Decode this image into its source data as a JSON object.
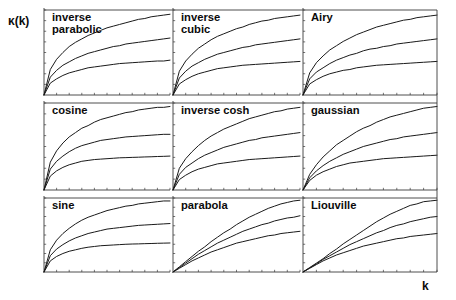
{
  "axes": {
    "ylabel": "κ(k)",
    "xlabel": "k"
  },
  "chart_data": {
    "type": "line",
    "title": "",
    "xlabel": "k",
    "ylabel": "κ(k)",
    "grid": false,
    "legend": "none",
    "layout": {
      "rows": 3,
      "cols": 3,
      "shared_axes": true
    },
    "axis_ranges": {
      "xlim": [
        0,
        1
      ],
      "ylim": [
        0,
        1
      ]
    },
    "series_count_per_panel": 3,
    "series_names": [
      "curve-1",
      "curve-2",
      "curve-3"
    ],
    "x": [
      0,
      0.05,
      0.1,
      0.15,
      0.2,
      0.25,
      0.3,
      0.35,
      0.4,
      0.45,
      0.5,
      0.55,
      0.6,
      0.65,
      0.7,
      0.75,
      0.8,
      0.85,
      0.9,
      0.95,
      1.0
    ],
    "panels": [
      {
        "id": "inverse-parabolic",
        "label": "inverse parabolic",
        "row": 0,
        "col": 0,
        "series": [
          {
            "name": "curve-1",
            "values": [
              0,
              0.3,
              0.42,
              0.5,
              0.57,
              0.62,
              0.66,
              0.7,
              0.73,
              0.76,
              0.79,
              0.81,
              0.83,
              0.85,
              0.87,
              0.89,
              0.9,
              0.92,
              0.93,
              0.94,
              0.95
            ]
          },
          {
            "name": "curve-2",
            "values": [
              0,
              0.21,
              0.29,
              0.35,
              0.39,
              0.43,
              0.46,
              0.49,
              0.51,
              0.53,
              0.55,
              0.57,
              0.58,
              0.6,
              0.61,
              0.62,
              0.63,
              0.64,
              0.65,
              0.66,
              0.67
            ]
          },
          {
            "name": "curve-3",
            "values": [
              0,
              0.14,
              0.19,
              0.23,
              0.26,
              0.28,
              0.3,
              0.32,
              0.33,
              0.34,
              0.35,
              0.36,
              0.37,
              0.375,
              0.38,
              0.385,
              0.39,
              0.395,
              0.4,
              0.4,
              0.41
            ]
          }
        ]
      },
      {
        "id": "inverse-cubic",
        "label": "inverse cubic",
        "row": 0,
        "col": 1,
        "series": [
          {
            "name": "curve-1",
            "values": [
              0,
              0.28,
              0.4,
              0.48,
              0.55,
              0.6,
              0.65,
              0.69,
              0.72,
              0.75,
              0.78,
              0.8,
              0.83,
              0.85,
              0.87,
              0.88,
              0.9,
              0.91,
              0.92,
              0.93,
              0.94
            ]
          },
          {
            "name": "curve-2",
            "values": [
              0,
              0.2,
              0.28,
              0.34,
              0.38,
              0.42,
              0.45,
              0.48,
              0.5,
              0.52,
              0.54,
              0.56,
              0.57,
              0.59,
              0.6,
              0.61,
              0.62,
              0.63,
              0.64,
              0.65,
              0.66
            ]
          },
          {
            "name": "curve-3",
            "values": [
              0,
              0.13,
              0.18,
              0.22,
              0.25,
              0.27,
              0.29,
              0.31,
              0.32,
              0.33,
              0.34,
              0.35,
              0.355,
              0.36,
              0.365,
              0.37,
              0.375,
              0.38,
              0.385,
              0.39,
              0.395
            ]
          }
        ]
      },
      {
        "id": "airy",
        "label": "Airy",
        "row": 0,
        "col": 2,
        "series": [
          {
            "name": "curve-1",
            "values": [
              0,
              0.26,
              0.38,
              0.46,
              0.53,
              0.58,
              0.63,
              0.67,
              0.71,
              0.74,
              0.77,
              0.8,
              0.82,
              0.84,
              0.86,
              0.88,
              0.89,
              0.91,
              0.92,
              0.93,
              0.94
            ]
          },
          {
            "name": "curve-2",
            "values": [
              0,
              0.19,
              0.27,
              0.32,
              0.37,
              0.41,
              0.44,
              0.47,
              0.49,
              0.52,
              0.54,
              0.55,
              0.57,
              0.58,
              0.6,
              0.61,
              0.62,
              0.63,
              0.64,
              0.65,
              0.66
            ]
          },
          {
            "name": "curve-3",
            "values": [
              0,
              0.13,
              0.18,
              0.22,
              0.25,
              0.27,
              0.29,
              0.3,
              0.32,
              0.33,
              0.34,
              0.35,
              0.355,
              0.36,
              0.365,
              0.37,
              0.375,
              0.38,
              0.385,
              0.39,
              0.395
            ]
          }
        ]
      },
      {
        "id": "cosine",
        "label": "cosine",
        "row": 1,
        "col": 0,
        "series": [
          {
            "name": "curve-1",
            "values": [
              0,
              0.32,
              0.45,
              0.54,
              0.61,
              0.66,
              0.71,
              0.74,
              0.78,
              0.81,
              0.83,
              0.85,
              0.87,
              0.89,
              0.9,
              0.92,
              0.93,
              0.94,
              0.95,
              0.95,
              0.96
            ]
          },
          {
            "name": "curve-2",
            "values": [
              0,
              0.24,
              0.33,
              0.39,
              0.44,
              0.48,
              0.51,
              0.53,
              0.55,
              0.57,
              0.58,
              0.59,
              0.6,
              0.61,
              0.615,
              0.62,
              0.625,
              0.63,
              0.635,
              0.64,
              0.64
            ]
          },
          {
            "name": "curve-3",
            "values": [
              0,
              0.16,
              0.22,
              0.26,
              0.29,
              0.31,
              0.33,
              0.34,
              0.35,
              0.355,
              0.36,
              0.365,
              0.37,
              0.372,
              0.375,
              0.377,
              0.38,
              0.382,
              0.385,
              0.387,
              0.39
            ]
          }
        ]
      },
      {
        "id": "inverse-cosh",
        "label": "inverse cosh",
        "row": 1,
        "col": 1,
        "series": [
          {
            "name": "curve-1",
            "values": [
              0,
              0.25,
              0.36,
              0.44,
              0.51,
              0.57,
              0.62,
              0.66,
              0.7,
              0.73,
              0.76,
              0.79,
              0.82,
              0.84,
              0.86,
              0.88,
              0.9,
              0.91,
              0.93,
              0.94,
              0.95
            ]
          },
          {
            "name": "curve-2",
            "values": [
              0,
              0.18,
              0.26,
              0.31,
              0.36,
              0.4,
              0.43,
              0.46,
              0.49,
              0.51,
              0.53,
              0.55,
              0.57,
              0.58,
              0.6,
              0.61,
              0.62,
              0.63,
              0.64,
              0.65,
              0.66
            ]
          },
          {
            "name": "curve-3",
            "values": [
              0,
              0.12,
              0.17,
              0.21,
              0.24,
              0.26,
              0.28,
              0.3,
              0.31,
              0.32,
              0.33,
              0.34,
              0.35,
              0.355,
              0.36,
              0.365,
              0.37,
              0.375,
              0.38,
              0.385,
              0.39
            ]
          }
        ]
      },
      {
        "id": "gaussian",
        "label": "gaussian",
        "row": 1,
        "col": 2,
        "series": [
          {
            "name": "curve-1",
            "values": [
              0,
              0.18,
              0.29,
              0.38,
              0.45,
              0.52,
              0.57,
              0.62,
              0.67,
              0.71,
              0.74,
              0.78,
              0.81,
              0.84,
              0.86,
              0.88,
              0.9,
              0.92,
              0.94,
              0.95,
              0.96
            ]
          },
          {
            "name": "curve-2",
            "values": [
              0,
              0.14,
              0.22,
              0.28,
              0.33,
              0.37,
              0.41,
              0.44,
              0.47,
              0.5,
              0.52,
              0.54,
              0.56,
              0.58,
              0.59,
              0.61,
              0.62,
              0.63,
              0.64,
              0.65,
              0.66
            ]
          },
          {
            "name": "curve-3",
            "values": [
              0,
              0.11,
              0.17,
              0.21,
              0.24,
              0.27,
              0.29,
              0.31,
              0.32,
              0.33,
              0.34,
              0.35,
              0.36,
              0.365,
              0.37,
              0.375,
              0.38,
              0.385,
              0.39,
              0.395,
              0.4
            ]
          }
        ]
      },
      {
        "id": "sine",
        "label": "sine",
        "row": 2,
        "col": 0,
        "series": [
          {
            "name": "curve-1",
            "values": [
              0,
              0.3,
              0.43,
              0.52,
              0.59,
              0.65,
              0.7,
              0.74,
              0.77,
              0.8,
              0.83,
              0.85,
              0.87,
              0.89,
              0.9,
              0.92,
              0.93,
              0.94,
              0.95,
              0.96,
              0.96
            ]
          },
          {
            "name": "curve-2",
            "values": [
              0,
              0.22,
              0.31,
              0.37,
              0.42,
              0.46,
              0.49,
              0.52,
              0.54,
              0.56,
              0.58,
              0.59,
              0.6,
              0.61,
              0.62,
              0.63,
              0.635,
              0.64,
              0.645,
              0.65,
              0.655
            ]
          },
          {
            "name": "curve-3",
            "values": [
              0,
              0.15,
              0.21,
              0.25,
              0.28,
              0.3,
              0.32,
              0.335,
              0.345,
              0.355,
              0.36,
              0.365,
              0.37,
              0.375,
              0.378,
              0.38,
              0.383,
              0.385,
              0.388,
              0.39,
              0.392
            ]
          }
        ]
      },
      {
        "id": "parabola",
        "label": "parabola",
        "row": 2,
        "col": 1,
        "series": [
          {
            "name": "curve-1",
            "values": [
              0,
              0.07,
              0.14,
              0.21,
              0.28,
              0.34,
              0.41,
              0.47,
              0.53,
              0.58,
              0.64,
              0.69,
              0.74,
              0.78,
              0.82,
              0.86,
              0.89,
              0.92,
              0.94,
              0.96,
              0.97
            ]
          },
          {
            "name": "curve-2",
            "values": [
              0,
              0.06,
              0.12,
              0.18,
              0.24,
              0.29,
              0.34,
              0.39,
              0.43,
              0.47,
              0.51,
              0.55,
              0.58,
              0.61,
              0.64,
              0.66,
              0.69,
              0.71,
              0.73,
              0.74,
              0.76
            ]
          },
          {
            "name": "curve-3",
            "values": [
              0,
              0.05,
              0.1,
              0.15,
              0.19,
              0.23,
              0.27,
              0.3,
              0.33,
              0.36,
              0.39,
              0.41,
              0.43,
              0.45,
              0.47,
              0.49,
              0.5,
              0.52,
              0.53,
              0.54,
              0.55
            ]
          }
        ]
      },
      {
        "id": "liouville",
        "label": "Liouville",
        "row": 2,
        "col": 2,
        "series": [
          {
            "name": "curve-1",
            "values": [
              0,
              0.06,
              0.12,
              0.18,
              0.25,
              0.31,
              0.38,
              0.44,
              0.5,
              0.56,
              0.62,
              0.68,
              0.73,
              0.78,
              0.82,
              0.86,
              0.9,
              0.92,
              0.95,
              0.96,
              0.97
            ]
          },
          {
            "name": "curve-2",
            "values": [
              0,
              0.055,
              0.11,
              0.17,
              0.22,
              0.27,
              0.32,
              0.37,
              0.41,
              0.45,
              0.49,
              0.53,
              0.56,
              0.6,
              0.63,
              0.65,
              0.68,
              0.7,
              0.72,
              0.74,
              0.75
            ]
          },
          {
            "name": "curve-3",
            "values": [
              0,
              0.05,
              0.1,
              0.15,
              0.19,
              0.23,
              0.26,
              0.29,
              0.32,
              0.35,
              0.37,
              0.39,
              0.41,
              0.43,
              0.45,
              0.46,
              0.48,
              0.49,
              0.5,
              0.51,
              0.52
            ]
          }
        ]
      }
    ]
  },
  "colors": {
    "curve": "#1a1a1a",
    "axis": "#3a3a3a",
    "background": "#ffffff"
  }
}
